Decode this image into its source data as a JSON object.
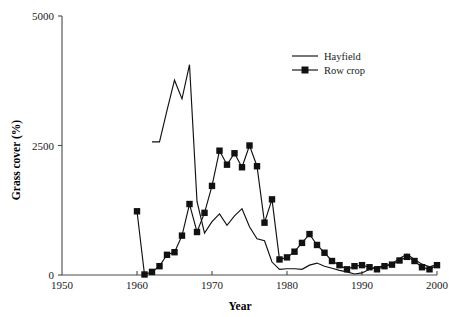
{
  "chart_data": {
    "type": "line",
    "title": "",
    "xlabel": "Year",
    "ylabel": "Grass cover (%)",
    "xlim": [
      1950,
      2000
    ],
    "ylim": [
      0,
      5000
    ],
    "xticks": [
      1950,
      1960,
      1970,
      1980,
      1990,
      2000
    ],
    "xtick_labels": [
      "1950",
      "1960",
      "1970",
      "1980",
      "1990",
      "2000"
    ],
    "yticks": [
      0,
      2500,
      5000
    ],
    "ytick_labels": [
      "0",
      "2500",
      "5000"
    ],
    "grid": false,
    "legend_position": "top-right",
    "series": [
      {
        "name": "Hayfield",
        "marker": "none",
        "color": "#111111",
        "x": [
          1962,
          1963,
          1964,
          1965,
          1966,
          1967,
          1968,
          1969,
          1970,
          1971,
          1972,
          1973,
          1974,
          1975,
          1976,
          1977,
          1978,
          1979,
          1980,
          1981,
          1982,
          1983,
          1984,
          1985,
          1986,
          1987,
          1988,
          1989,
          1990,
          1991,
          1992,
          1993,
          1994,
          1995,
          1996,
          1997,
          1998,
          1999,
          2000
        ],
        "values": [
          2570,
          2570,
          3180,
          3760,
          3400,
          4060,
          1420,
          810,
          1030,
          1180,
          960,
          1140,
          1280,
          930,
          700,
          660,
          250,
          110,
          120,
          120,
          110,
          190,
          230,
          170,
          130,
          90,
          60,
          20,
          40,
          110,
          160,
          170,
          220,
          320,
          400,
          300,
          210,
          160,
          200
        ]
      },
      {
        "name": "Row crop",
        "marker": "square",
        "color": "#111111",
        "x": [
          1960,
          1961,
          1962,
          1963,
          1964,
          1965,
          1966,
          1967,
          1968,
          1969,
          1970,
          1971,
          1972,
          1973,
          1974,
          1975,
          1976,
          1977,
          1978,
          1979,
          1980,
          1981,
          1982,
          1983,
          1984,
          1985,
          1986,
          1987,
          1988,
          1989,
          1990,
          1991,
          1992,
          1993,
          1994,
          1995,
          1996,
          1997,
          1998,
          1999,
          2000
        ],
        "values": [
          1230,
          10,
          60,
          170,
          390,
          440,
          760,
          1370,
          830,
          1200,
          1720,
          2400,
          2130,
          2350,
          2080,
          2500,
          2100,
          1010,
          1460,
          300,
          340,
          450,
          620,
          790,
          580,
          430,
          270,
          190,
          110,
          170,
          190,
          150,
          110,
          170,
          200,
          280,
          350,
          270,
          150,
          110,
          190
        ]
      }
    ]
  },
  "legend": {
    "entries": [
      {
        "label": "Hayfield",
        "marker": "none"
      },
      {
        "label": "Row crop",
        "marker": "square"
      }
    ]
  },
  "axes": {
    "y_axis_title": "Grass cover (%)",
    "x_axis_title": "Year"
  }
}
